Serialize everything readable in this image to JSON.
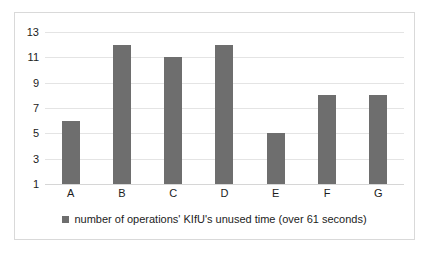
{
  "chart_data": {
    "type": "bar",
    "title": "",
    "subtitle": "",
    "xlabel": "",
    "ylabel": "",
    "categories": [
      "A",
      "B",
      "C",
      "D",
      "E",
      "F",
      "G"
    ],
    "values": [
      6,
      12,
      11,
      12,
      5,
      8,
      8
    ],
    "ylim": [
      1,
      13
    ],
    "yticks": [
      1,
      3,
      5,
      7,
      9,
      11,
      13
    ],
    "ytick_labels": [
      "1",
      "3",
      "5",
      "7",
      "9",
      "11",
      "13"
    ],
    "grid": true,
    "grid_axis": "y",
    "legend_position": "bottom",
    "legend": [
      {
        "label": "number of operations' KIfU's unused time (over 61 seconds)",
        "color": "#6e6e6e",
        "marker": "square"
      }
    ],
    "series": [
      {
        "name": "number of operations' KIfU's unused time (over 61 seconds)",
        "color": "#6e6e6e",
        "values": [
          6,
          12,
          11,
          12,
          5,
          8,
          8
        ]
      }
    ]
  },
  "colors": {
    "bar": "#6e6e6e",
    "gridline": "#e4e4e4",
    "baseline": "#d6d6d6",
    "frame_border": "#d9d9d9",
    "background": "#ffffff",
    "text": "#1c1c1c"
  }
}
